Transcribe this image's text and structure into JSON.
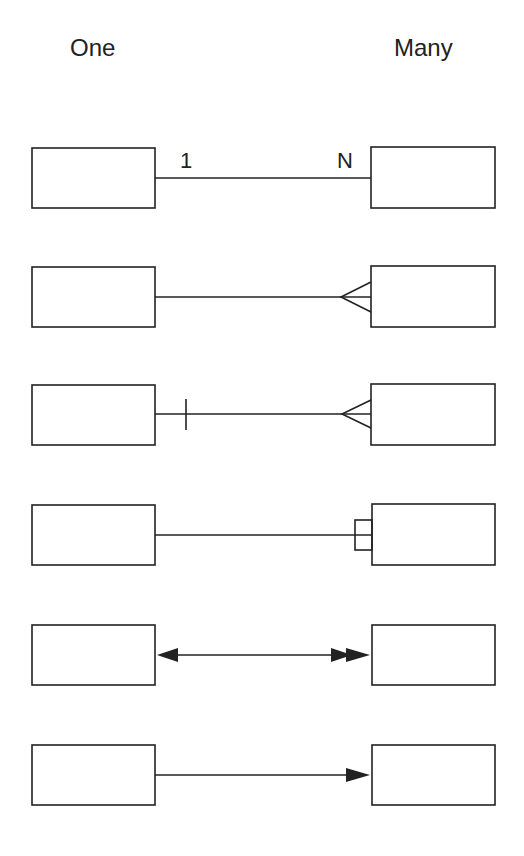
{
  "headers": {
    "left": "One",
    "right": "Many"
  },
  "rows": [
    {
      "notation": "number-labels",
      "left_label": "1",
      "right_label": "N"
    },
    {
      "notation": "crows-foot"
    },
    {
      "notation": "bar-and-crows-foot"
    },
    {
      "notation": "box-end"
    },
    {
      "notation": "single-and-double-arrowhead"
    },
    {
      "notation": "single-arrowhead"
    }
  ],
  "colors": {
    "stroke": "#222222",
    "background": "#ffffff"
  }
}
